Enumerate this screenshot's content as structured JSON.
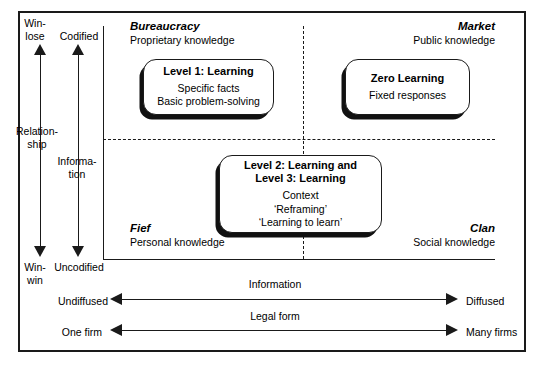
{
  "figure": {
    "type": "conceptual-matrix"
  },
  "axes": {
    "vertical_left": {
      "name": "Relationship",
      "top_label": "Win-\nlose",
      "bottom_label": "Win-\nwin",
      "top_label_line1": "Win-",
      "top_label_line2": "lose",
      "bottom_label_line1": "Win-",
      "bottom_label_line2": "win"
    },
    "vertical_right": {
      "name": "Informa-\ntion",
      "name_line1": "Informa-",
      "name_line2": "tion",
      "top_label": "Codified",
      "bottom_label": "Uncodified"
    },
    "horizontal_top": {
      "name": "Information",
      "left_label": "Undiffused",
      "right_label": "Diffused"
    },
    "horizontal_bottom": {
      "name": "Legal form",
      "left_label": "One firm",
      "right_label": "Many firms"
    },
    "relationship_label_line1": "Relation-",
    "relationship_label_line2": "ship"
  },
  "quadrants": [
    {
      "id": "bureaucracy",
      "name": "Bureaucracy",
      "subtitle": "Proprietary knowledge",
      "position": "top-left",
      "align": "left"
    },
    {
      "id": "market",
      "name": "Market",
      "subtitle": "Public knowledge",
      "position": "top-right",
      "align": "right"
    },
    {
      "id": "fief",
      "name": "Fief",
      "subtitle": "Personal knowledge",
      "position": "bottom-left",
      "align": "left"
    },
    {
      "id": "clan",
      "name": "Clan",
      "subtitle": "Social knowledge",
      "position": "bottom-right",
      "align": "right"
    }
  ],
  "boxes": [
    {
      "id": "level-1",
      "heading": "Level 1: Learning",
      "body": "Specific facts\nBasic problem-solving",
      "quadrant": "bureaucracy"
    },
    {
      "id": "zero-learning",
      "heading": "Zero Learning",
      "body": "Fixed responses",
      "quadrant": "market"
    },
    {
      "id": "level-2-3",
      "heading": "Level 2: Learning and\nLevel 3: Learning",
      "body": "Context\n‘Reframing’\n‘Learning to learn’",
      "quadrant": "fief-clan"
    }
  ],
  "colors": {
    "ink": "#1a1a1a",
    "background": "#ffffff",
    "shadow": "#111111"
  }
}
